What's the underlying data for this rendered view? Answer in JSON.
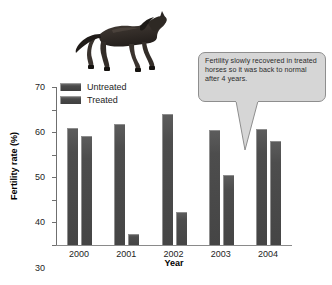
{
  "chart_data": {
    "type": "bar",
    "title": "",
    "xlabel": "Year",
    "ylabel": "Fertility rate (%)",
    "categories": [
      "2000",
      "2001",
      "2002",
      "2003",
      "2004"
    ],
    "series": [
      {
        "name": "Untreated",
        "values": [
          52,
          53.5,
          58,
          51,
          51.5
        ]
      },
      {
        "name": "Treated",
        "values": [
          48.5,
          5,
          14.5,
          31,
          46
        ]
      }
    ],
    "ylim": [
      0,
      70
    ],
    "yticks": [
      0,
      10,
      20,
      30,
      40,
      50,
      60,
      70
    ],
    "grid": false,
    "legend_position": "upper-left-inside",
    "bar_color": "#4a4a4a"
  },
  "legend": {
    "items": [
      {
        "label": "Untreated",
        "swatch_name": "legend-swatch-untreated"
      },
      {
        "label": "Treated",
        "swatch_name": "legend-swatch-treated"
      }
    ]
  },
  "callout": {
    "text": "Fertility slowly recovered in treated horses so it was back to normal after 4 years.",
    "fill_color": "#d6d6d6",
    "border_color": "#8e8e8e",
    "points_to": "2004 Treated bar"
  },
  "illustration": {
    "name": "galloping-horse",
    "description": "Dark galloping horse",
    "color": "#3a3430"
  }
}
